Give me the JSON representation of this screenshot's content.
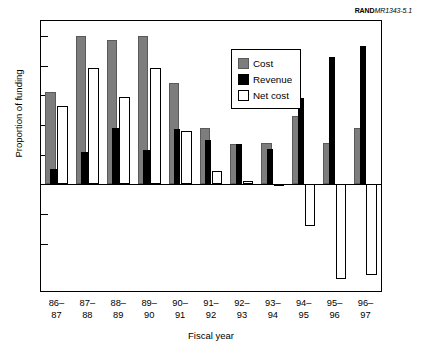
{
  "credit": {
    "publisher": "RAND",
    "document_id": "MR1343-5.1"
  },
  "legend": {
    "items": [
      {
        "label": "Cost",
        "swatch": "gray-square-icon",
        "color": "#7d7d7d"
      },
      {
        "label": "Revenue",
        "swatch": "black-square-icon",
        "color": "#000000"
      },
      {
        "label": "Net cost",
        "swatch": "white-square-icon",
        "color": "#ffffff"
      }
    ]
  },
  "chart_data": {
    "type": "bar",
    "title": "",
    "xlabel": "Fiscal year",
    "ylabel": "Proportion of funding",
    "categories": [
      "86–\n87",
      "87–\n88",
      "88–\n89",
      "89–\n90",
      "90–\n91",
      "91–\n92",
      "92–\n93",
      "93–\n94",
      "94–\n95",
      "95–\n96",
      "96–\n97"
    ],
    "category_lines": [
      [
        "86–",
        "87"
      ],
      [
        "87–",
        "88"
      ],
      [
        "88–",
        "89"
      ],
      [
        "89–",
        "90"
      ],
      [
        "90–",
        "91"
      ],
      [
        "91–",
        "92"
      ],
      [
        "92–",
        "93"
      ],
      [
        "93–",
        "94"
      ],
      [
        "94–",
        "95"
      ],
      [
        "95–",
        "96"
      ],
      [
        "96–",
        "97"
      ]
    ],
    "series": [
      {
        "name": "Cost",
        "color": "#7d7d7d",
        "values": [
          0.62,
          1.0,
          0.97,
          1.0,
          0.68,
          0.38,
          0.27,
          0.28,
          0.46,
          0.28,
          0.38
        ]
      },
      {
        "name": "Revenue",
        "color": "#000000",
        "values": [
          0.1,
          0.22,
          0.38,
          0.23,
          0.37,
          0.3,
          0.27,
          0.24,
          0.58,
          0.86,
          0.93
        ]
      },
      {
        "name": "Net cost",
        "color": "#ffffff",
        "values": [
          0.53,
          0.78,
          0.59,
          0.78,
          0.36,
          0.09,
          0.02,
          -0.01,
          -0.28,
          -0.64,
          -0.61
        ]
      }
    ],
    "ylim": [
      -0.72,
      1.1
    ],
    "y_tick_values": [
      1.0,
      0.8,
      0.6,
      0.4,
      0.2,
      0.0,
      -0.2,
      -0.4
    ],
    "y_tick_labels_shown": false,
    "zero_line": 0,
    "grid": false,
    "legend_position": "upper-right-inside"
  }
}
